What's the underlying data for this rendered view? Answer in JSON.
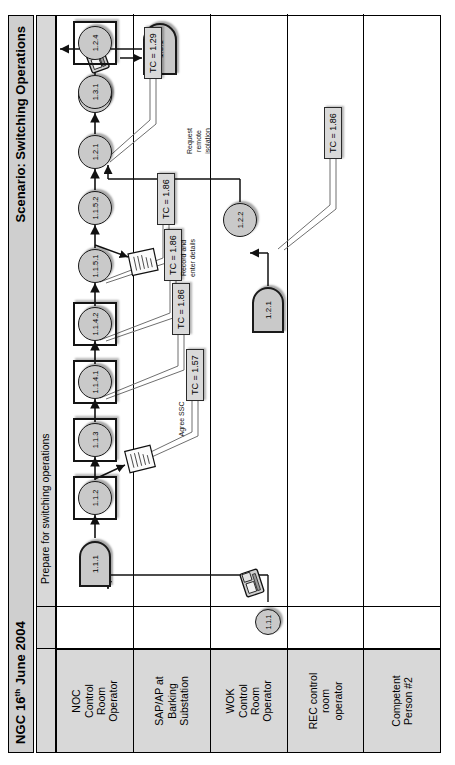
{
  "header": {
    "left_title": "NGC 16",
    "left_sup": "th",
    "left_rest": " June 2004",
    "right_title": "Scenario:  Switching Operations"
  },
  "phase": {
    "label": "Prepare for switching operations"
  },
  "lanes": [
    {
      "id": "noc",
      "label": "NOC\nControl\nRoom\nOperator"
    },
    {
      "id": "sap",
      "label": "SAP/AP at\nBarking\nSubstation"
    },
    {
      "id": "wok",
      "label": "WOK\nControl\nRoom\nOperator"
    },
    {
      "id": "rec",
      "label": "REC control\nroom\noperator"
    },
    {
      "id": "cp2",
      "label": "Competent\nPerson #2"
    }
  ],
  "nodes": [
    {
      "id": "n111_wok",
      "label": "1.1.1",
      "lane": "wok",
      "shape": "circle"
    },
    {
      "id": "n111_noc",
      "label": "1.1.1",
      "lane": "noc",
      "shape": "dshape"
    },
    {
      "id": "n112",
      "label": "1.1.2",
      "lane": "noc",
      "shape": "circle-boxed"
    },
    {
      "id": "n113",
      "label": "1.1.3",
      "lane": "noc",
      "shape": "circle-boxed"
    },
    {
      "id": "n1141",
      "label": "1.1.4.1",
      "lane": "noc",
      "shape": "circle-boxed"
    },
    {
      "id": "n1142",
      "label": "1.1.4.2",
      "lane": "noc",
      "shape": "circle-boxed"
    },
    {
      "id": "n1151",
      "label": "1.1.5.1",
      "lane": "noc",
      "shape": "circle"
    },
    {
      "id": "n1152",
      "label": "1.1.5.2",
      "lane": "noc",
      "shape": "circle"
    },
    {
      "id": "n121_noc",
      "label": "1.2.1",
      "lane": "noc",
      "shape": "circle"
    },
    {
      "id": "n121_wok",
      "label": "1.2.1",
      "lane": "wok",
      "shape": "dshape"
    },
    {
      "id": "n122",
      "label": "1.2.2",
      "lane": "wok",
      "shape": "circle"
    },
    {
      "id": "n123",
      "label": "1.2.3",
      "lane": "noc",
      "shape": "circle"
    },
    {
      "id": "n124",
      "label": "1.2.4",
      "lane": "noc",
      "shape": "circle-boxed"
    },
    {
      "id": "n131_noc",
      "label": "1.3.1",
      "lane": "noc",
      "shape": "circle"
    },
    {
      "id": "n131_sap",
      "label": "1.3.1",
      "lane": "sap",
      "shape": "rrect"
    }
  ],
  "tc_labels": [
    {
      "id": "tc157",
      "text": "TC = 1.57"
    },
    {
      "id": "tc186a",
      "text": "TC = 1.86"
    },
    {
      "id": "tc186b",
      "text": "TC = 1.86"
    },
    {
      "id": "tc186c",
      "text": "TC = 1.86"
    },
    {
      "id": "tc186d",
      "text": "TC = 1.86"
    },
    {
      "id": "tc129",
      "text": "TC = 1.29"
    }
  ],
  "annotations": [
    {
      "id": "a_agree",
      "text": "Agree SSC"
    },
    {
      "id": "a_record",
      "text": "Record and\nenter details"
    },
    {
      "id": "a_request",
      "text": "Request\nremote\nisolation"
    }
  ],
  "icons": [
    {
      "id": "phone-icon-1",
      "name": "telephone-icon"
    },
    {
      "id": "phone-icon-2",
      "name": "telephone-icon"
    },
    {
      "id": "doc-icon-1",
      "name": "document-icon"
    },
    {
      "id": "doc-icon-2",
      "name": "document-icon"
    }
  ],
  "colors": {
    "header_band": "#cfcfcf",
    "lane_head": "#d8d8d8",
    "node_fill": "#c9c9c9",
    "tc_fill": "#d9d9d9",
    "stroke": "#1a1a1a"
  }
}
